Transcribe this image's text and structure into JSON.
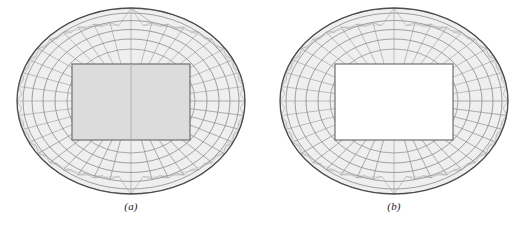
{
  "figure": {
    "type": "engineering-drawing",
    "background_color": "#ffffff",
    "panels": [
      {
        "id": "a",
        "caption": "(a)",
        "infill_color": "#d0d0d0",
        "infill_visible": true,
        "outline_color": "#4d4d4d",
        "lattice_color": "#808080",
        "ring_count": 5,
        "radial_count": 40,
        "opening": {
          "shape": "rectangle",
          "filled": true,
          "divider": true
        }
      },
      {
        "id": "b",
        "caption": "(b)",
        "infill_color": "#ffffff",
        "infill_visible": false,
        "outline_color": "#4d4d4d",
        "lattice_color": "#808080",
        "ring_count": 5,
        "radial_count": 40,
        "opening": {
          "shape": "rectangle",
          "filled": false,
          "divider": false
        }
      }
    ]
  }
}
